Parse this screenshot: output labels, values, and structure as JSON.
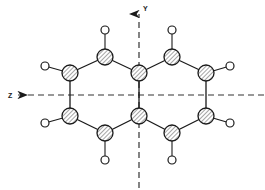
{
  "figure": {
    "background_color": "#ffffff",
    "width": 265,
    "height": 190
  },
  "chart_data": {
    "type": "diagram",
    "title": "",
    "atom_styles": {
      "ring_atom": {
        "name": "carbon",
        "shape": "circle",
        "fill": "hatched",
        "radius": 8,
        "stroke": "#1a1a1a",
        "hatch_color": "#555555"
      },
      "terminal_atom": {
        "name": "hydrogen",
        "shape": "circle",
        "fill": "#ffffff",
        "radius": 4,
        "stroke": "#1a1a1a"
      }
    },
    "ring_atoms": [
      {
        "id": "C1",
        "label": "",
        "x": 105,
        "y": 57
      },
      {
        "id": "C2",
        "label": "",
        "x": 172,
        "y": 57
      },
      {
        "id": "C3",
        "label": "",
        "x": 70,
        "y": 73
      },
      {
        "id": "C4",
        "label": "",
        "x": 139,
        "y": 73
      },
      {
        "id": "C5",
        "label": "",
        "x": 206,
        "y": 73
      },
      {
        "id": "C6",
        "label": "",
        "x": 70,
        "y": 116
      },
      {
        "id": "C7",
        "label": "",
        "x": 139,
        "y": 116
      },
      {
        "id": "C8",
        "label": "",
        "x": 206,
        "y": 116
      },
      {
        "id": "C9",
        "label": "",
        "x": 105,
        "y": 133
      },
      {
        "id": "C10",
        "label": "",
        "x": 172,
        "y": 133
      }
    ],
    "terminal_atoms": [
      {
        "id": "H1",
        "label": "",
        "x": 105,
        "y": 30
      },
      {
        "id": "H2",
        "label": "",
        "x": 172,
        "y": 30
      },
      {
        "id": "H3",
        "label": "",
        "x": 45,
        "y": 66
      },
      {
        "id": "H4",
        "label": "",
        "x": 230,
        "y": 66
      },
      {
        "id": "H5",
        "label": "",
        "x": 45,
        "y": 123
      },
      {
        "id": "H6",
        "label": "",
        "x": 230,
        "y": 123
      },
      {
        "id": "H7",
        "label": "",
        "x": 105,
        "y": 160
      },
      {
        "id": "H8",
        "label": "",
        "x": 172,
        "y": 160
      }
    ],
    "ring_bonds": [
      [
        "C3",
        "C1"
      ],
      [
        "C1",
        "C4"
      ],
      [
        "C4",
        "C2"
      ],
      [
        "C2",
        "C5"
      ],
      [
        "C3",
        "C6"
      ],
      [
        "C4",
        "C7"
      ],
      [
        "C5",
        "C8"
      ],
      [
        "C6",
        "C9"
      ],
      [
        "C9",
        "C7"
      ],
      [
        "C7",
        "C10"
      ],
      [
        "C10",
        "C8"
      ]
    ],
    "terminal_bonds": [
      [
        "C1",
        "H1"
      ],
      [
        "C2",
        "H2"
      ],
      [
        "C3",
        "H3"
      ],
      [
        "C5",
        "H4"
      ],
      [
        "C6",
        "H5"
      ],
      [
        "C8",
        "H6"
      ],
      [
        "C9",
        "H7"
      ],
      [
        "C10",
        "H8"
      ]
    ],
    "axes": [
      {
        "id": "y-axis",
        "label": "Y",
        "orientation": "vertical",
        "style": "dashed",
        "arrow_direction": "up",
        "x": 139,
        "y_start": 14,
        "y_end": 188,
        "label_x": 143,
        "label_y": 11
      },
      {
        "id": "z-axis",
        "label": "Z",
        "orientation": "horizontal",
        "style": "dashed",
        "arrow_direction": "left",
        "y": 95,
        "x_start": 18,
        "x_end": 264,
        "label_x": 8,
        "label_y": 98
      }
    ],
    "colors": {
      "stroke": "#1a1a1a",
      "axis": "#333333",
      "hatch": "#555555",
      "background": "#ffffff"
    }
  }
}
